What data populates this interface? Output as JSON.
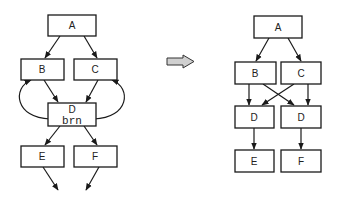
{
  "diagram": {
    "colors": {
      "stroke": "#1a1a1a",
      "box_fill": "#ffffff",
      "transform_arrow_fill": "#d0d0d0"
    },
    "before": {
      "nodes": [
        {
          "id": "A",
          "label": "A"
        },
        {
          "id": "B",
          "label": "B"
        },
        {
          "id": "C",
          "label": "C"
        },
        {
          "id": "D",
          "label": "D",
          "sublabel": "brn"
        },
        {
          "id": "E",
          "label": "E"
        },
        {
          "id": "F",
          "label": "F"
        }
      ],
      "edges": [
        [
          "A",
          "B"
        ],
        [
          "A",
          "C"
        ],
        [
          "B",
          "D"
        ],
        [
          "C",
          "D"
        ],
        [
          "D",
          "B"
        ],
        [
          "D",
          "C"
        ],
        [
          "D",
          "E"
        ],
        [
          "D",
          "F"
        ],
        [
          "E",
          "out"
        ],
        [
          "F",
          "out"
        ]
      ]
    },
    "transform_arrow": {
      "icon": "right-arrow-icon"
    },
    "after": {
      "nodes": [
        {
          "id": "A",
          "label": "A"
        },
        {
          "id": "B",
          "label": "B"
        },
        {
          "id": "C",
          "label": "C"
        },
        {
          "id": "D1",
          "label": "D"
        },
        {
          "id": "D2",
          "label": "D"
        },
        {
          "id": "E",
          "label": "E"
        },
        {
          "id": "F",
          "label": "F"
        }
      ],
      "edges": [
        [
          "A",
          "B"
        ],
        [
          "A",
          "C"
        ],
        [
          "B",
          "D1"
        ],
        [
          "B",
          "D2"
        ],
        [
          "C",
          "D1"
        ],
        [
          "C",
          "D2"
        ],
        [
          "D1",
          "E"
        ],
        [
          "D2",
          "F"
        ]
      ]
    }
  }
}
